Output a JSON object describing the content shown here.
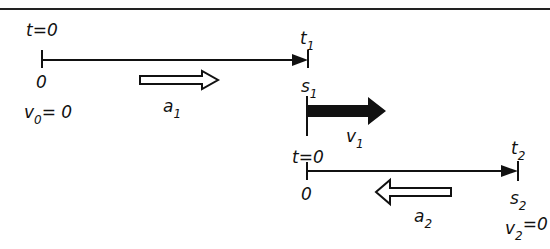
{
  "diagram": {
    "type": "kinematics-motion-phases",
    "phase1": {
      "start_time_label": "t=0",
      "start_position_label": "0",
      "initial_velocity": {
        "symbol": "v",
        "subscript": "0",
        "value_text": "= 0"
      },
      "acceleration": {
        "symbol": "a",
        "subscript": "1",
        "direction": "right",
        "style": "hollow-arrow"
      },
      "end_time": {
        "symbol": "t",
        "subscript": "1"
      },
      "end_position": {
        "symbol": "s",
        "subscript": "1"
      }
    },
    "transition": {
      "velocity": {
        "symbol": "v",
        "subscript": "1",
        "direction": "right",
        "style": "solid-arrow"
      }
    },
    "phase2": {
      "start_time_label": "t=0",
      "start_position_label": "0",
      "acceleration": {
        "symbol": "a",
        "subscript": "2",
        "direction": "left",
        "style": "hollow-arrow"
      },
      "end_time": {
        "symbol": "t",
        "subscript": "2"
      },
      "end_position": {
        "symbol": "s",
        "subscript": "2"
      },
      "final_velocity": {
        "symbol": "v",
        "subscript": "2",
        "value_text": "=0"
      }
    },
    "colors": {
      "ink": "#111111",
      "background": "#ffffff"
    }
  }
}
